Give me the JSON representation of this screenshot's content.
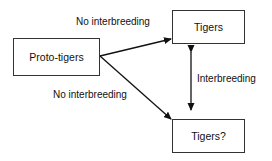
{
  "nodes": {
    "proto": {
      "label": "Proto-tigers"
    },
    "tigers": {
      "label": "Tigers"
    },
    "tigers_q": {
      "label": "Tigers?"
    }
  },
  "edges": {
    "top": {
      "label": "No interbreeding"
    },
    "bottom": {
      "label": "No interbreeding"
    },
    "vertical": {
      "label": "Interbreeding"
    }
  }
}
